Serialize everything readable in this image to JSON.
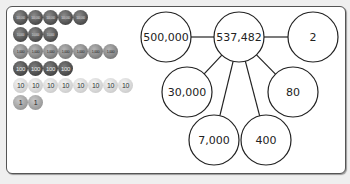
{
  "coin_rows": [
    {
      "label": "100,000",
      "count": 5,
      "class": "c-100000"
    },
    {
      "label": "10,000",
      "count": 3,
      "class": "c-10000"
    },
    {
      "label": "1,000",
      "count": 7,
      "class": "c-1000"
    },
    {
      "label": "100",
      "count": 4,
      "class": "c-100"
    },
    {
      "label": "10",
      "count": 8,
      "class": "c-10"
    },
    {
      "label": "1",
      "count": 2,
      "class": "c-1"
    }
  ],
  "diagram": {
    "center": {
      "label": "537,482",
      "cx": 239,
      "cy": 37
    },
    "parts": [
      {
        "label": "500,000",
        "cx": 166,
        "cy": 37
      },
      {
        "label": "30,000",
        "cx": 187,
        "cy": 92
      },
      {
        "label": "7,000",
        "cx": 214,
        "cy": 140
      },
      {
        "label": "400",
        "cx": 266,
        "cy": 140
      },
      {
        "label": "80",
        "cx": 293,
        "cy": 92
      },
      {
        "label": "2",
        "cx": 313,
        "cy": 37
      }
    ],
    "radius": 25,
    "stroke_color": "#222222",
    "fill_color": "#ffffff"
  }
}
